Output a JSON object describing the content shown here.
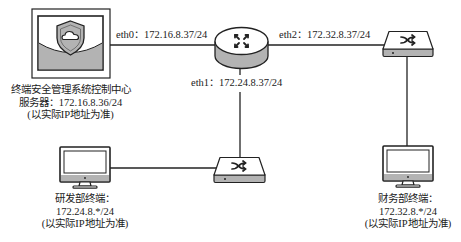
{
  "diagram": {
    "type": "network-topology",
    "links": {
      "eth0": {
        "label": "eth0：172.16.8.37/24"
      },
      "eth1": {
        "label": "eth1：172.24.8.37/24"
      },
      "eth2": {
        "label": "eth2：172.32.8.37/24"
      }
    },
    "nodes": {
      "server": {
        "icon": "shield-cloud-server-icon",
        "line1": "终端安全管理系统控制中心",
        "line2": "服务器：172.16.8.36/24",
        "line3": "(以实际IP地址为准)"
      },
      "router": {
        "icon": "router-icon"
      },
      "switch_top": {
        "icon": "switch-icon"
      },
      "switch_bottom": {
        "icon": "switch-icon"
      },
      "rd_terminal": {
        "icon": "monitor-icon",
        "line1": "研发部终端：",
        "line2": "172.24.8.*/24",
        "line3": "(以实际IP地址为准)"
      },
      "finance_terminal": {
        "icon": "monitor-icon",
        "line1": "财务部终端：",
        "line2": "172.32.8.*/24",
        "line3": "(以实际IP地址为准)"
      }
    },
    "colors": {
      "stroke": "#222222",
      "gray_fill": "#b3b3b3",
      "device_fill": "#ffffff"
    }
  }
}
